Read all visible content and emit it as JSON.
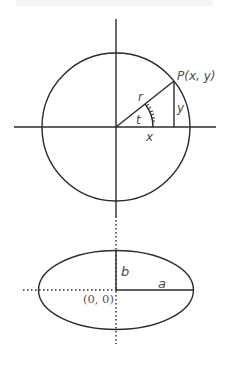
{
  "colors": {
    "stroke": "#2a2a2a",
    "label": "#4a4a4a",
    "background": "#ffffff"
  },
  "circle_diagram": {
    "point_label": "P(x, y)",
    "radius_label": "r",
    "angle_label": "t",
    "x_label": "x",
    "y_label": "y"
  },
  "ellipse_diagram": {
    "semi_major_label": "a",
    "semi_minor_label": "b",
    "origin_label": "(0, 0)"
  }
}
